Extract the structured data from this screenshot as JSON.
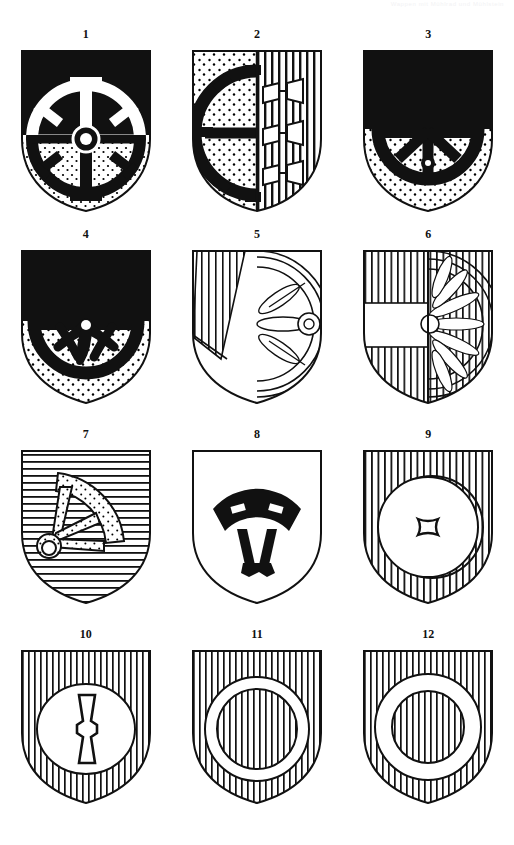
{
  "header": {
    "running_text": "Wappen mit Mühlrad und Mühlstein"
  },
  "page": {
    "background": "#ffffff",
    "ink": "#000000",
    "columns": 3,
    "rows": 4,
    "count": 12
  },
  "shields": [
    {
      "number": "1",
      "name": "shield-1",
      "description": "Per fess sable and argent semy, a mill wheel counterchanged with cogged hub",
      "field": "per-fess-sable-stippled",
      "charge": "mill-wheel-counterchanged",
      "outline": "pointed-round"
    },
    {
      "number": "2",
      "name": "shield-2",
      "description": "Per pale: dexter stippled with a demi mill wheel sable; sinister hatched with three mill-irons argent",
      "field": "per-pale-stipple-vertical-hatch",
      "charge": "demi-mill-wheel-and-three-mill-irons",
      "outline": "pointed-round"
    },
    {
      "number": "3",
      "name": "shield-3",
      "description": "Chief sable, base stippled, a demi mill wheel sable issuing",
      "field": "chief-sable-base-stippled",
      "charge": "demi-mill-wheel-spoked",
      "outline": "pointed-round"
    },
    {
      "number": "4",
      "name": "shield-4",
      "description": "Chief sable, base stippled, a demi mill wheel sable with curved spokes",
      "field": "chief-sable-base-stippled",
      "charge": "demi-mill-wheel-curved-spokes",
      "outline": "pointed-round"
    },
    {
      "number": "5",
      "name": "shield-5",
      "description": "A bend hatched, a demi water wheel in sinister, vertically hatched",
      "field": "bend-vertical-hatch",
      "charge": "demi-water-wheel",
      "outline": "pointed-round"
    },
    {
      "number": "6",
      "name": "shield-6",
      "description": "Per pale vertically hatched, a fess argent in dexter, a demi paddle wheel in sinister",
      "field": "per-pale-hatched-with-fess",
      "charge": "demi-paddle-wheel-many-spokes",
      "outline": "pointed-round"
    },
    {
      "number": "7",
      "name": "shield-7",
      "description": "Field barry/horizontally hatched, a quarter mill wheel segment stippled with spokes and hub",
      "field": "horizontal-hatch",
      "charge": "quarter-wheel-segment",
      "outline": "pointed-round"
    },
    {
      "number": "8",
      "name": "shield-8",
      "description": "Argent, a wheel segment sable with two spokes and hub",
      "field": "plain-argent",
      "charge": "wheel-segment-sable",
      "outline": "pointed-round"
    },
    {
      "number": "9",
      "name": "shield-9",
      "description": "Field vertically hatched, a millstone argent pierced with a square eye",
      "field": "vertical-hatch",
      "charge": "millstone-square-eye",
      "outline": "pointed-round"
    },
    {
      "number": "10",
      "name": "shield-10",
      "description": "Field vertically hatched, a millstone argent charged with a mill-iron palewise",
      "field": "vertical-hatch",
      "charge": "millstone-with-mill-iron",
      "outline": "pointed-round"
    },
    {
      "number": "11",
      "name": "shield-11",
      "description": "Field vertically hatched, an annulet argent, inner field hatched",
      "field": "vertical-hatch",
      "charge": "annulet-narrow",
      "outline": "pointed-round"
    },
    {
      "number": "12",
      "name": "shield-12",
      "description": "Field vertically hatched, a broad annulet argent, inner field hatched",
      "field": "vertical-hatch",
      "charge": "annulet-broad",
      "outline": "pointed-round"
    }
  ]
}
